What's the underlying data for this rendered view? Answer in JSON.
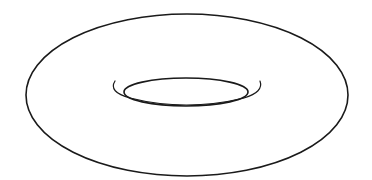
{
  "figure": {
    "line_color": "#1a1a1a",
    "background_color": "#ffffff"
  }
}
